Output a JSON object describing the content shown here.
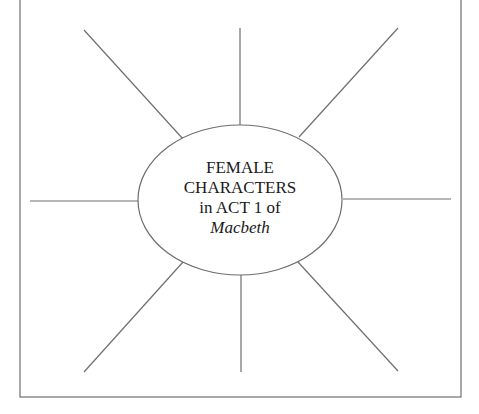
{
  "diagram": {
    "type": "spider-map",
    "center": {
      "lines": [
        "FEMALE",
        "CHARACTERS",
        "in ACT 1 of"
      ],
      "italic_line": "Macbeth"
    },
    "spokes": [
      {
        "id": "top",
        "x1": 240,
        "y1": 28,
        "x2": 240,
        "y2": 125
      },
      {
        "id": "top-right",
        "x1": 398,
        "y1": 28,
        "x2": 299,
        "y2": 137
      },
      {
        "id": "right",
        "x1": 343,
        "y1": 199,
        "x2": 451,
        "y2": 199
      },
      {
        "id": "bottom-right",
        "x1": 298,
        "y1": 262,
        "x2": 398,
        "y2": 371
      },
      {
        "id": "bottom",
        "x1": 241,
        "y1": 275,
        "x2": 241,
        "y2": 372
      },
      {
        "id": "bottom-left",
        "x1": 183,
        "y1": 262,
        "x2": 84,
        "y2": 372
      },
      {
        "id": "left",
        "x1": 30,
        "y1": 201,
        "x2": 138,
        "y2": 201
      },
      {
        "id": "top-left",
        "x1": 84,
        "y1": 30,
        "x2": 183,
        "y2": 139
      }
    ],
    "ellipse": {
      "cx": 240,
      "cy": 200,
      "rx": 102,
      "ry": 75
    },
    "frame": {
      "left": 20,
      "right": 461,
      "top": -2,
      "bottom": 397
    },
    "colors": {
      "line": "#6e6e6e",
      "frame": "#6e6e6e",
      "text": "#1a1a1a",
      "background": "#ffffff"
    }
  }
}
